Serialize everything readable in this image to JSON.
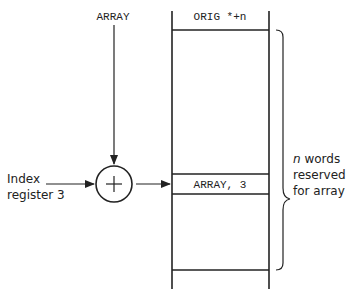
{
  "diagram": {
    "type": "indexed-addressing",
    "top_input_label": "ARRAY",
    "left_input_label_line1": "Index",
    "left_input_label_line2": "register 3",
    "adder_symbol": "+",
    "memory": {
      "header_label": "ORIG *+n",
      "selected_cell_label": "ARRAY, 3"
    },
    "brace_annotation": {
      "line1_italic": "n",
      "line1_rest": " words",
      "line2": "reserved",
      "line3": "for array"
    },
    "colors": {
      "stroke": "#222222",
      "background": "#ffffff"
    }
  }
}
